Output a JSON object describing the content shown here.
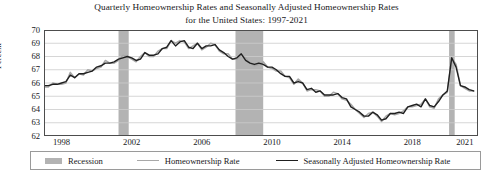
{
  "chart_data": {
    "type": "line",
    "title": "Quarterly Homeownership Rates and Seasonally Adjusted Homeownership Rates for the United States: 1997-2021",
    "title_line1": "Quarterly Homeownership Rates and Seasonally Adjusted Homeownership Rates",
    "title_line2": "for the United States: 1997-2021",
    "xlabel": "",
    "ylabel": "Percent",
    "ylim": [
      62,
      70
    ],
    "xlim": [
      1997.0,
      2021.75
    ],
    "grid": true,
    "legend_position": "bottom",
    "yticks": [
      70,
      69,
      68,
      67,
      66,
      65,
      64,
      63,
      62
    ],
    "xticks": [
      1998,
      2002,
      2006,
      2010,
      2014,
      2018,
      2021
    ],
    "colors": {
      "recession_band": "#b3b3b3",
      "homeownership_rate": "#a8a8a8",
      "seasonally_adjusted": "#1f1f1f",
      "gridline": "#cccccc",
      "axis": "#4d4d4d",
      "background": "#ffffff"
    },
    "recessions": [
      {
        "label": "2001 recession",
        "start": 2001.25,
        "end": 2001.83
      },
      {
        "label": "2007-2009 recession",
        "start": 2007.92,
        "end": 2009.5
      },
      {
        "label": "2020 recession",
        "start": 2020.1,
        "end": 2020.42
      }
    ],
    "x": [
      1997.0,
      1997.25,
      1997.5,
      1997.75,
      1998.0,
      1998.25,
      1998.5,
      1998.75,
      1999.0,
      1999.25,
      1999.5,
      1999.75,
      2000.0,
      2000.25,
      2000.5,
      2000.75,
      2001.0,
      2001.25,
      2001.5,
      2001.75,
      2002.0,
      2002.25,
      2002.5,
      2002.75,
      2003.0,
      2003.25,
      2003.5,
      2003.75,
      2004.0,
      2004.25,
      2004.5,
      2004.75,
      2005.0,
      2005.25,
      2005.5,
      2005.75,
      2006.0,
      2006.25,
      2006.5,
      2006.75,
      2007.0,
      2007.25,
      2007.5,
      2007.75,
      2008.0,
      2008.25,
      2008.5,
      2008.75,
      2009.0,
      2009.25,
      2009.5,
      2009.75,
      2010.0,
      2010.25,
      2010.5,
      2010.75,
      2011.0,
      2011.25,
      2011.5,
      2011.75,
      2012.0,
      2012.25,
      2012.5,
      2012.75,
      2013.0,
      2013.25,
      2013.5,
      2013.75,
      2014.0,
      2014.25,
      2014.5,
      2014.75,
      2015.0,
      2015.25,
      2015.5,
      2015.75,
      2016.0,
      2016.25,
      2016.5,
      2016.75,
      2017.0,
      2017.25,
      2017.5,
      2017.75,
      2018.0,
      2018.25,
      2018.5,
      2018.75,
      2019.0,
      2019.25,
      2019.5,
      2019.75,
      2020.0,
      2020.25,
      2020.5,
      2020.75,
      2021.0,
      2021.25,
      2021.5
    ],
    "series": [
      {
        "name": "Homeownership Rate",
        "color": "#a8a8a8",
        "values": [
          65.7,
          65.7,
          66.0,
          65.9,
          65.9,
          66.0,
          66.8,
          66.4,
          66.7,
          66.6,
          67.0,
          66.9,
          67.1,
          67.2,
          67.7,
          67.5,
          67.5,
          67.7,
          68.1,
          68.0,
          67.8,
          67.6,
          68.0,
          68.3,
          68.0,
          68.0,
          68.4,
          68.6,
          68.6,
          69.2,
          69.0,
          69.2,
          69.1,
          68.6,
          68.8,
          69.0,
          68.5,
          68.7,
          69.0,
          68.9,
          68.4,
          68.2,
          68.2,
          67.8,
          67.8,
          68.1,
          67.9,
          67.5,
          67.3,
          67.4,
          67.6,
          67.2,
          67.1,
          66.9,
          66.9,
          66.5,
          66.4,
          65.9,
          66.3,
          66.0,
          65.4,
          65.5,
          65.5,
          65.4,
          65.0,
          65.0,
          65.3,
          65.2,
          64.8,
          64.7,
          64.4,
          64.0,
          63.7,
          63.4,
          63.7,
          63.8,
          63.5,
          63.1,
          63.5,
          63.7,
          63.6,
          63.7,
          63.9,
          64.2,
          64.2,
          64.3,
          64.4,
          64.8,
          64.2,
          64.1,
          64.8,
          65.1,
          65.3,
          67.9,
          67.4,
          65.8,
          65.6,
          65.4,
          65.4
        ]
      },
      {
        "name": "Seasonally Adjusted Homeownership Rate",
        "color": "#1f1f1f",
        "values": [
          65.8,
          65.8,
          65.9,
          65.9,
          66.0,
          66.1,
          66.6,
          66.4,
          66.7,
          66.7,
          66.8,
          66.9,
          67.2,
          67.3,
          67.5,
          67.5,
          67.6,
          67.8,
          67.9,
          68.0,
          67.9,
          67.7,
          67.8,
          68.3,
          68.1,
          68.1,
          68.2,
          68.6,
          68.7,
          69.2,
          68.8,
          69.1,
          69.2,
          68.7,
          68.6,
          69.0,
          68.6,
          68.8,
          68.8,
          68.9,
          68.5,
          68.3,
          68.0,
          67.8,
          67.9,
          68.2,
          67.7,
          67.5,
          67.4,
          67.5,
          67.4,
          67.2,
          67.2,
          67.0,
          66.7,
          66.5,
          66.5,
          66.0,
          66.1,
          66.0,
          65.5,
          65.6,
          65.3,
          65.4,
          65.1,
          65.1,
          65.1,
          65.2,
          64.9,
          64.8,
          64.2,
          64.0,
          63.8,
          63.5,
          63.5,
          63.8,
          63.6,
          63.2,
          63.3,
          63.7,
          63.7,
          63.8,
          63.7,
          64.2,
          64.3,
          64.4,
          64.2,
          64.8,
          64.3,
          64.2,
          64.6,
          65.1,
          65.4,
          67.9,
          67.2,
          65.8,
          65.7,
          65.5,
          65.4
        ]
      }
    ]
  },
  "legend": {
    "items": [
      {
        "label": "Recession",
        "marker": "rect",
        "color": "#b3b3b3"
      },
      {
        "label": "Homeownership Rate",
        "marker": "line",
        "color": "#a8a8a8"
      },
      {
        "label": "Seasonally Adjusted Homeownership Rate",
        "marker": "line",
        "color": "#1f1f1f"
      }
    ]
  },
  "axes": {
    "ylabel": "Percent",
    "yticks": [
      "70",
      "69",
      "68",
      "67",
      "66",
      "65",
      "64",
      "63",
      "62"
    ],
    "xticks": [
      "1998",
      "2002",
      "2006",
      "2010",
      "2014",
      "2018",
      "2021"
    ]
  }
}
